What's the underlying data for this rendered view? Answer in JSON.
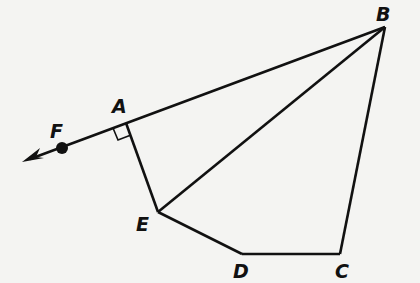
{
  "diagram": {
    "type": "geometry-figure",
    "stroke_color": "#111111",
    "background": "#f4f4f2",
    "points": {
      "A": {
        "label": "A",
        "x": 126,
        "y": 123
      },
      "B": {
        "label": "B",
        "x": 385,
        "y": 27
      },
      "C": {
        "label": "C",
        "x": 340,
        "y": 254
      },
      "D": {
        "label": "D",
        "x": 242,
        "y": 254
      },
      "E": {
        "label": "E",
        "x": 158,
        "y": 212
      },
      "F": {
        "label": "F",
        "x": 62,
        "y": 148
      }
    },
    "segments": [
      "AB",
      "AE",
      "EB",
      "ED",
      "DC",
      "CB"
    ],
    "ray": {
      "from": "B",
      "through": "F",
      "arrow": true
    },
    "right_angle_at": "A",
    "labels": {
      "A": "A",
      "B": "B",
      "C": "C",
      "D": "D",
      "E": "E",
      "F": "F"
    }
  }
}
